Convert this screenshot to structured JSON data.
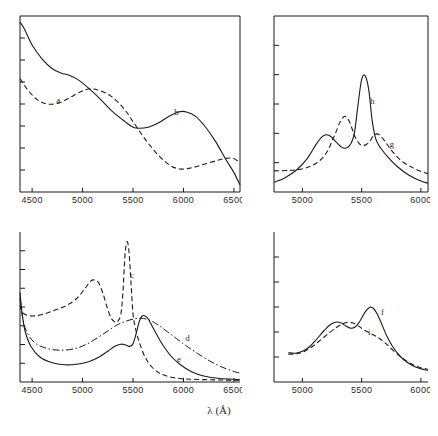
{
  "figure": {
    "xlabel": "λ (Å)",
    "panels": [
      {
        "id": "top-left",
        "xticks": [
          4500,
          5000,
          5500,
          6000,
          6500
        ],
        "xticklabels": [
          "4500",
          "5000",
          "5500",
          "6000",
          "6500"
        ],
        "xlim": [
          4380,
          6560
        ],
        "ylim": [
          0,
          1
        ],
        "n_yticks": 7,
        "curves": [
          {
            "name": "a",
            "label": "a",
            "style": "dashed",
            "label_x": 4760,
            "label_y": 0.505
          },
          {
            "name": "b",
            "label": "b",
            "style": "solid",
            "label_x": 5930,
            "label_y": 0.435
          }
        ]
      },
      {
        "id": "top-right",
        "xticks": [
          5000,
          5500,
          6000
        ],
        "xticklabels": [
          "5000",
          "5500",
          "6000"
        ],
        "xlim": [
          4760,
          6060
        ],
        "ylim": [
          0,
          1
        ],
        "n_yticks": 5,
        "curves": [
          {
            "name": "h",
            "label": "h",
            "style": "solid",
            "label_x": 5590,
            "label_y": 0.5
          },
          {
            "name": "g",
            "label": "g",
            "style": "dashed",
            "label_x": 5755,
            "label_y": 0.255
          }
        ]
      },
      {
        "id": "bottom-left",
        "xticks": [
          4500,
          5000,
          5500,
          6000,
          6500
        ],
        "xticklabels": [
          "4500",
          "5000",
          "5500",
          "6000",
          "6500"
        ],
        "xlim": [
          4380,
          6560
        ],
        "ylim": [
          0,
          1
        ],
        "n_yticks": 7,
        "curves": [
          {
            "name": "c",
            "label": "c",
            "style": "dashed",
            "label_x": 5490,
            "label_y": 0.695
          },
          {
            "name": "d",
            "label": "d",
            "style": "dashdot",
            "label_x": 6040,
            "label_y": 0.275
          },
          {
            "name": "e",
            "label": "e",
            "style": "solid",
            "label_x": 5955,
            "label_y": 0.135
          }
        ]
      },
      {
        "id": "bottom-right",
        "xticks": [
          5000,
          5500,
          6000
        ],
        "xticklabels": [
          "5000",
          "5500",
          "6000"
        ],
        "xlim": [
          4760,
          6060
        ],
        "ylim": [
          0,
          1
        ],
        "n_yticks": 5,
        "curves": [
          {
            "name": "f",
            "label": "f",
            "style": "solid",
            "label_x": 5675,
            "label_y": 0.445
          },
          {
            "name": "i",
            "label": "i",
            "style": "dashed",
            "label_x": 5565,
            "label_y": 0.315
          }
        ]
      }
    ]
  },
  "chart_data": {
    "type": "line",
    "title": "",
    "xlabel": "λ (Å)",
    "ylabel": "",
    "panel_count": 4,
    "panels": [
      {
        "id": "top-left",
        "xlim": [
          4380,
          6560
        ],
        "ylim": [
          0,
          1
        ],
        "grid": false,
        "xticklabels": [
          "4500",
          "5000",
          "5500",
          "6000",
          "6500"
        ],
        "series": [
          {
            "name": "a",
            "style": "dashed",
            "x": [
              4380,
              4450,
              4550,
              4650,
              4760,
              4870,
              4980,
              5060,
              5150,
              5280,
              5400,
              5500,
              5620,
              5750,
              5870,
              5980,
              6100,
              6220,
              6340,
              6430,
              6500,
              6560
            ],
            "y": [
              0.645,
              0.585,
              0.525,
              0.5,
              0.505,
              0.535,
              0.57,
              0.585,
              0.58,
              0.545,
              0.48,
              0.4,
              0.3,
              0.21,
              0.15,
              0.13,
              0.14,
              0.16,
              0.18,
              0.192,
              0.19,
              0.165
            ]
          },
          {
            "name": "b",
            "style": "solid",
            "x": [
              4380,
              4420,
              4500,
              4600,
              4700,
              4790,
              4860,
              4950,
              5060,
              5180,
              5300,
              5420,
              5500,
              5560,
              5650,
              5750,
              5850,
              5950,
              6030,
              6120,
              6220,
              6320,
              6420,
              6500,
              6560
            ],
            "y": [
              0.965,
              0.93,
              0.835,
              0.755,
              0.7,
              0.675,
              0.665,
              0.64,
              0.59,
              0.525,
              0.455,
              0.4,
              0.368,
              0.362,
              0.368,
              0.392,
              0.428,
              0.455,
              0.455,
              0.43,
              0.368,
              0.285,
              0.185,
              0.11,
              0.04
            ]
          }
        ]
      },
      {
        "id": "top-right",
        "xlim": [
          4760,
          6060
        ],
        "ylim": [
          0,
          1
        ],
        "grid": false,
        "xticklabels": [
          "5000",
          "5500",
          "6000"
        ],
        "series": [
          {
            "name": "h",
            "style": "solid",
            "x": [
              4760,
              4850,
              4950,
              5040,
              5110,
              5160,
              5200,
              5240,
              5290,
              5330,
              5370,
              5410,
              5440,
              5470,
              5500,
              5530,
              5560,
              5590,
              5620,
              5660,
              5720,
              5800,
              5900,
              6000,
              6060
            ],
            "y": [
              0.055,
              0.08,
              0.125,
              0.19,
              0.265,
              0.31,
              0.325,
              0.315,
              0.28,
              0.255,
              0.25,
              0.275,
              0.34,
              0.5,
              0.64,
              0.66,
              0.58,
              0.4,
              0.3,
              0.25,
              0.2,
              0.145,
              0.095,
              0.062,
              0.05
            ]
          },
          {
            "name": "g",
            "style": "dashed",
            "x": [
              4760,
              4900,
              5020,
              5120,
              5200,
              5270,
              5320,
              5360,
              5400,
              5440,
              5480,
              5510,
              5540,
              5570,
              5600,
              5630,
              5660,
              5700,
              5760,
              5840,
              5940,
              6020,
              6060
            ],
            "y": [
              0.12,
              0.123,
              0.135,
              0.165,
              0.22,
              0.32,
              0.4,
              0.43,
              0.395,
              0.32,
              0.275,
              0.265,
              0.27,
              0.29,
              0.32,
              0.33,
              0.318,
              0.285,
              0.23,
              0.175,
              0.135,
              0.112,
              0.105
            ]
          }
        ]
      },
      {
        "id": "bottom-left",
        "xlim": [
          4380,
          6560
        ],
        "ylim": [
          0,
          1
        ],
        "grid": false,
        "xticklabels": [
          "4500",
          "5000",
          "5500",
          "6000",
          "6500"
        ],
        "series": [
          {
            "name": "c",
            "style": "dashed",
            "x": [
              4380,
              4400,
              4430,
              4500,
              4600,
              4720,
              4840,
              4940,
              5020,
              5080,
              5120,
              5160,
              5200,
              5240,
              5280,
              5320,
              5350,
              5380,
              5400,
              5420,
              5440,
              5460,
              5480,
              5500,
              5530,
              5570,
              5620,
              5680,
              5760,
              5860,
              5980,
              6100,
              6250,
              6400,
              6560
            ],
            "y": [
              0.51,
              0.47,
              0.45,
              0.44,
              0.45,
              0.478,
              0.51,
              0.555,
              0.62,
              0.672,
              0.68,
              0.66,
              0.595,
              0.505,
              0.43,
              0.4,
              0.405,
              0.455,
              0.6,
              0.84,
              0.935,
              0.87,
              0.66,
              0.455,
              0.34,
              0.25,
              0.165,
              0.105,
              0.06,
              0.035,
              0.022,
              0.018,
              0.015,
              0.013,
              0.012
            ]
          },
          {
            "name": "d",
            "style": "dashdot",
            "x": [
              4380,
              4400,
              4440,
              4520,
              4640,
              4780,
              4920,
              5040,
              5160,
              5260,
              5340,
              5400,
              5460,
              5520,
              5580,
              5640,
              5700,
              5760,
              5840,
              5930,
              6030,
              6140,
              6260,
              6380,
              6500,
              6560
            ],
            "y": [
              0.56,
              0.45,
              0.345,
              0.265,
              0.225,
              0.212,
              0.222,
              0.252,
              0.3,
              0.345,
              0.38,
              0.398,
              0.412,
              0.422,
              0.425,
              0.418,
              0.4,
              0.375,
              0.335,
              0.29,
              0.24,
              0.19,
              0.14,
              0.1,
              0.07,
              0.06
            ]
          },
          {
            "name": "e",
            "style": "solid",
            "x": [
              4380,
              4400,
              4430,
              4490,
              4580,
              4700,
              4820,
              4940,
              5060,
              5160,
              5250,
              5320,
              5380,
              5420,
              5450,
              5470,
              5500,
              5530,
              5560,
              5590,
              5620,
              5650,
              5690,
              5740,
              5800,
              5880,
              5970,
              6080,
              6200,
              6340,
              6500,
              6560
            ],
            "y": [
              0.595,
              0.465,
              0.34,
              0.235,
              0.165,
              0.128,
              0.115,
              0.118,
              0.135,
              0.165,
              0.205,
              0.238,
              0.252,
              0.248,
              0.24,
              0.238,
              0.255,
              0.32,
              0.4,
              0.44,
              0.44,
              0.42,
              0.372,
              0.31,
              0.242,
              0.17,
              0.115,
              0.068,
              0.04,
              0.025,
              0.018,
              0.015
            ]
          }
        ]
      },
      {
        "id": "bottom-right",
        "xlim": [
          4760,
          6060
        ],
        "ylim": [
          0,
          1
        ],
        "grid": false,
        "xticklabels": [
          "5000",
          "5500",
          "6000"
        ],
        "series": [
          {
            "name": "f",
            "style": "solid",
            "x": [
              4880,
              4940,
              5000,
              5060,
              5120,
              5180,
              5240,
              5290,
              5330,
              5370,
              5410,
              5450,
              5490,
              5530,
              5570,
              5600,
              5630,
              5670,
              5710,
              5760,
              5820,
              5890,
              5960,
              6030,
              6060
            ],
            "y": [
              0.195,
              0.192,
              0.205,
              0.235,
              0.285,
              0.34,
              0.385,
              0.4,
              0.392,
              0.372,
              0.358,
              0.37,
              0.412,
              0.468,
              0.498,
              0.49,
              0.455,
              0.385,
              0.31,
              0.238,
              0.175,
              0.128,
              0.098,
              0.082,
              0.078
            ]
          },
          {
            "name": "i",
            "style": "dashed",
            "x": [
              4880,
              4950,
              5020,
              5090,
              5160,
              5230,
              5290,
              5340,
              5380,
              5420,
              5460,
              5500,
              5540,
              5580,
              5620,
              5660,
              5710,
              5770,
              5840,
              5910,
              5980,
              6040,
              6060
            ],
            "y": [
              0.185,
              0.188,
              0.205,
              0.24,
              0.285,
              0.33,
              0.365,
              0.388,
              0.398,
              0.395,
              0.38,
              0.358,
              0.338,
              0.322,
              0.305,
              0.285,
              0.252,
              0.208,
              0.163,
              0.125,
              0.1,
              0.088,
              0.085
            ]
          }
        ]
      }
    ]
  }
}
